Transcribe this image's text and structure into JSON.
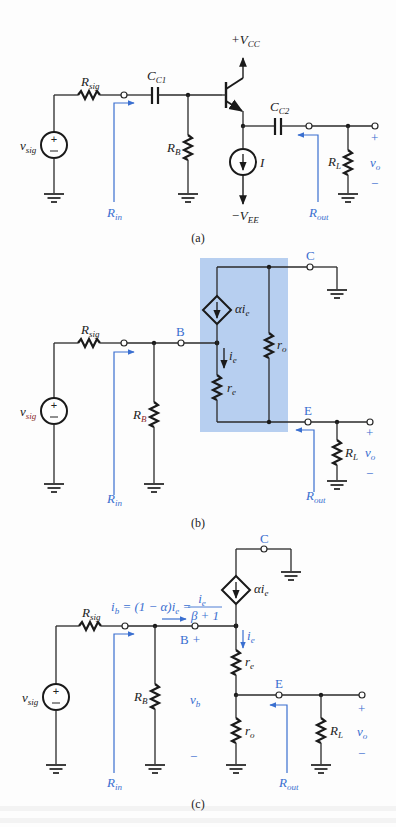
{
  "figure": {
    "panels": [
      {
        "id": "a",
        "caption": "(a)",
        "labels": {
          "vcc": "+V",
          "vcc_sub": "CC",
          "vee": "−V",
          "vee_sub": "EE",
          "rsig": "R",
          "rsig_sub": "sig",
          "cc1": "C",
          "cc1_sub": "C1",
          "cc2": "C",
          "cc2_sub": "C2",
          "rb": "R",
          "rb_sub": "B",
          "rl": "R",
          "rl_sub": "L",
          "i": "I",
          "vsig": "v",
          "vsig_sub": "sig",
          "vo": "v",
          "vo_sub": "o",
          "plus": "+",
          "minus": "−",
          "rin": "R",
          "rin_sub": "in",
          "rout": "R",
          "rout_sub": "out"
        }
      },
      {
        "id": "b",
        "caption": "(b)",
        "labels": {
          "node_c": "C",
          "node_b": "B",
          "node_e": "E",
          "dep_source": "αi",
          "dep_source_sub": "e",
          "ie": "i",
          "ie_sub": "e",
          "re": "r",
          "re_sub": "e",
          "ro": "r",
          "ro_sub": "o",
          "rsig": "R",
          "rsig_sub": "sig",
          "rb": "R",
          "rb_sub": "B",
          "rl": "R",
          "rl_sub": "L",
          "vsig": "v",
          "vsig_sub": "sig",
          "vo": "v",
          "vo_sub": "o",
          "plus": "+",
          "minus": "−",
          "rin": "R",
          "rin_sub": "in",
          "rout": "R",
          "rout_sub": "out"
        },
        "highlight_color": "#b7cff0"
      },
      {
        "id": "c",
        "caption": "(c)",
        "labels": {
          "node_c": "C",
          "node_b": "B",
          "node_b_plus": "+",
          "node_e": "E",
          "dep_source": "αi",
          "dep_source_sub": "e",
          "ib_eq_left": "i",
          "ib_eq_left_sub": "b",
          "ib_eq_mid": " = (1 − α)i",
          "ib_eq_mid_sub": "e",
          "ib_eq_eq": " =",
          "ib_frac_num": "i",
          "ib_frac_num_sub": "e",
          "ib_frac_den": "β + 1",
          "ie": "i",
          "ie_sub": "e",
          "re": "r",
          "re_sub": "e",
          "ro": "r",
          "ro_sub": "o",
          "rsig": "R",
          "rsig_sub": "sig",
          "rb": "R",
          "rb_sub": "B",
          "rl": "R",
          "rl_sub": "L",
          "vb": "v",
          "vb_sub": "b",
          "vsig": "v",
          "vsig_sub": "sig",
          "vo": "v",
          "vo_sub": "o",
          "plus": "+",
          "minus": "−",
          "rin": "R",
          "rin_sub": "in",
          "rout": "R",
          "rout_sub": "out"
        }
      }
    ],
    "colors": {
      "wire": "#2a2a2a",
      "annotation_blue": "#3a6fd0",
      "highlight_box": "#b7cff0",
      "background": "#fdfdfd"
    }
  }
}
